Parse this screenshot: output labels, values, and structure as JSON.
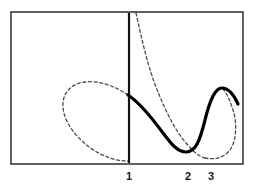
{
  "figure": {
    "background_color": "#ffffff",
    "frame": {
      "color": "#3a3a3a",
      "stroke_width": 1.6,
      "x": 11,
      "y": 12,
      "width": 232,
      "height": 152
    },
    "axis": {
      "vertical_asymptote_label": "1",
      "asymptote_color": "#111111",
      "asymptote_stroke_width": 2.2,
      "asymptote_x": 129,
      "asymptote_y_top": 13,
      "asymptote_y_bottom": 163
    },
    "x_ticks": [
      {
        "label": "1",
        "x": 129,
        "y": 180
      },
      {
        "label": "2",
        "x": 188,
        "y": 180
      },
      {
        "label": "3",
        "x": 211,
        "y": 180
      }
    ],
    "curves": [
      {
        "name": "solid-curve",
        "style": "solid",
        "color": "#000000",
        "stroke_width": 3.2,
        "description": "Main branch: drops from the asymptote at x=1, falls to a minimum near x=2, rises to a local maximum past x=3",
        "path": "M 128 95 C 140 103 152 118 163 133 C 172 145 178 152 186 152 C 196 152 200 140 205 120 C 210 100 215 88 222 88 C 229 88 234 95 238 104"
      },
      {
        "name": "dashed-upper-branch",
        "style": "dashed",
        "color": "#4a4a4a",
        "stroke_width": 1.3,
        "description": "Dashed branch rising steeply to the right of the asymptote toward the top of the frame",
        "path": "M 136 13 C 142 40 148 68 158 92 C 166 112 175 130 186 143 C 194 152 198 156 205 158"
      },
      {
        "name": "dashed-left-loop",
        "style": "dashed",
        "color": "#4a4a4a",
        "stroke_width": 1.3,
        "description": "Dashed closed loop extending to the left of the asymptote, meeting it at the curve start and near the bottom",
        "path": "M 128 95 C 115 86 98 80 85 82 C 70 84 62 94 63 107 C 64 122 76 138 92 149 C 104 157 116 161 128 161"
      },
      {
        "name": "dashed-right-loop",
        "style": "dashed",
        "color": "#4a4a4a",
        "stroke_width": 1.3,
        "description": "Dashed loop on the right wrapping around the local maximum back down to the bottom of the frame",
        "path": "M 205 158 C 214 160 224 158 230 150 C 237 140 237 122 233 110 C 230 100 226 92 222 88"
      }
    ]
  }
}
